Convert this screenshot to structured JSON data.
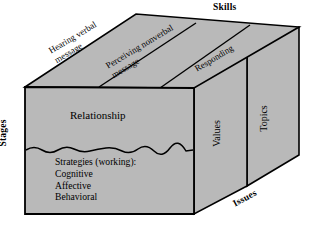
{
  "diagram": {
    "title_axes": {
      "skills": "Skills",
      "stages": "Stages",
      "issues": "Issues"
    },
    "top_face_bands": [
      {
        "line1": "Hearing verbal",
        "line2": "message"
      },
      {
        "line1": "Perceiving nonverbal",
        "line2": "message"
      },
      {
        "line1": "Responding",
        "line2": ""
      }
    ],
    "front_face": {
      "upper_label": "Relationship",
      "lower_heading": "Strategies (working):",
      "lower_items": [
        "Cognitive",
        "Affective",
        "Behavioral"
      ]
    },
    "side_faces": [
      {
        "label": "Values"
      },
      {
        "label": "Topics"
      }
    ],
    "colors": {
      "face_fill": "#b9b9b9",
      "outline": "#000000",
      "background": "#ffffff",
      "text": "#000000"
    }
  }
}
